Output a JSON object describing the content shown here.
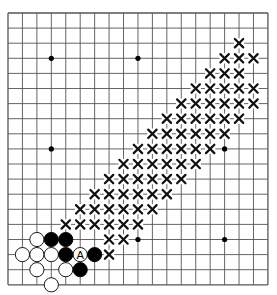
{
  "board": {
    "size": 19,
    "origin_x": 8,
    "origin_y": 13,
    "spacing_x": 14.44,
    "spacing_y": 15.1,
    "colors": {
      "line": "#555555",
      "black_stone": "#000000",
      "white_stone": "#ffffff",
      "stone_outline": "#000000",
      "mark": "#111111",
      "star": "#000000"
    },
    "star_points": [
      [
        3,
        3
      ],
      [
        9,
        3
      ],
      [
        15,
        3
      ],
      [
        3,
        9
      ],
      [
        9,
        9
      ],
      [
        15,
        9
      ],
      [
        3,
        15
      ],
      [
        9,
        15
      ],
      [
        15,
        15
      ]
    ],
    "black_stones": [
      [
        3,
        15
      ],
      [
        4,
        15
      ],
      [
        4,
        16
      ],
      [
        6,
        16
      ],
      [
        5,
        17
      ]
    ],
    "white_stones": [
      [
        2,
        15
      ],
      [
        1,
        16
      ],
      [
        2,
        16
      ],
      [
        3,
        16
      ],
      [
        2,
        17
      ],
      [
        4,
        17
      ],
      [
        3,
        18
      ],
      [
        5,
        16
      ]
    ],
    "labels": [
      {
        "col": 5,
        "row": 16,
        "text": "A",
        "on": "white"
      }
    ],
    "x_marks": [
      [
        16,
        2
      ],
      [
        15,
        3
      ],
      [
        16,
        3
      ],
      [
        17,
        3
      ],
      [
        14,
        4
      ],
      [
        15,
        4
      ],
      [
        16,
        4
      ],
      [
        13,
        5
      ],
      [
        14,
        5
      ],
      [
        15,
        5
      ],
      [
        16,
        5
      ],
      [
        17,
        5
      ],
      [
        12,
        6
      ],
      [
        13,
        6
      ],
      [
        14,
        6
      ],
      [
        15,
        6
      ],
      [
        16,
        6
      ],
      [
        17,
        6
      ],
      [
        11,
        7
      ],
      [
        12,
        7
      ],
      [
        13,
        7
      ],
      [
        14,
        7
      ],
      [
        15,
        7
      ],
      [
        16,
        7
      ],
      [
        10,
        8
      ],
      [
        11,
        8
      ],
      [
        12,
        8
      ],
      [
        13,
        8
      ],
      [
        14,
        8
      ],
      [
        15,
        8
      ],
      [
        9,
        9
      ],
      [
        10,
        9
      ],
      [
        11,
        9
      ],
      [
        12,
        9
      ],
      [
        13,
        9
      ],
      [
        14,
        9
      ],
      [
        8,
        10
      ],
      [
        9,
        10
      ],
      [
        10,
        10
      ],
      [
        11,
        10
      ],
      [
        12,
        10
      ],
      [
        13,
        10
      ],
      [
        7,
        11
      ],
      [
        8,
        11
      ],
      [
        9,
        11
      ],
      [
        10,
        11
      ],
      [
        11,
        11
      ],
      [
        12,
        11
      ],
      [
        6,
        12
      ],
      [
        7,
        12
      ],
      [
        8,
        12
      ],
      [
        9,
        12
      ],
      [
        10,
        12
      ],
      [
        11,
        12
      ],
      [
        5,
        13
      ],
      [
        6,
        13
      ],
      [
        7,
        13
      ],
      [
        8,
        13
      ],
      [
        9,
        13
      ],
      [
        10,
        13
      ],
      [
        4,
        14
      ],
      [
        5,
        14
      ],
      [
        6,
        14
      ],
      [
        7,
        14
      ],
      [
        8,
        14
      ],
      [
        9,
        14
      ],
      [
        7,
        15
      ],
      [
        8,
        15
      ],
      [
        7,
        16
      ]
    ]
  }
}
